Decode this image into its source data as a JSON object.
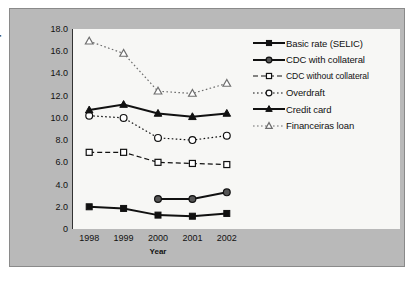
{
  "chart_data": {
    "type": "line",
    "title": "",
    "xlabel": "Year",
    "ylabel": "Percent per month",
    "categories": [
      "1998",
      "1999",
      "2000",
      "2001",
      "2002"
    ],
    "ylim": [
      0,
      18
    ],
    "ytick_labels": [
      "0",
      "2.0",
      "4.0",
      "6.0",
      "8.0",
      "10.0",
      "12.0",
      "14.0",
      "16.0",
      "18.0"
    ],
    "ytick_values": [
      0,
      2,
      4,
      6,
      8,
      10,
      12,
      14,
      16,
      18
    ],
    "grid": false,
    "legend_position": "right",
    "series": [
      {
        "name": "Basic rate (SELIC)",
        "marker": "filled-square",
        "line": "solid",
        "color": "#111111",
        "values": [
          2.0,
          1.85,
          1.25,
          1.15,
          1.4
        ]
      },
      {
        "name": "CDC with collateral",
        "marker": "filled-circle",
        "line": "solid",
        "color": "#111111",
        "values": [
          null,
          null,
          2.7,
          2.7,
          3.3
        ]
      },
      {
        "name": "CDC without collateral",
        "marker": "open-square",
        "line": "dashed",
        "color": "#111111",
        "values": [
          6.9,
          6.9,
          6.0,
          5.9,
          5.8
        ]
      },
      {
        "name": "Overdraft",
        "marker": "open-circle",
        "line": "dotted",
        "color": "#111111",
        "values": [
          10.2,
          10.0,
          8.2,
          8.0,
          8.4
        ]
      },
      {
        "name": "Credit card",
        "marker": "filled-triangle",
        "line": "solid",
        "color": "#111111",
        "values": [
          10.7,
          11.2,
          10.4,
          10.1,
          10.4
        ]
      },
      {
        "name": "Financeiras loan",
        "marker": "open-triangle",
        "line": "dotted",
        "color": "#6e6e6e",
        "values": [
          16.9,
          15.8,
          12.4,
          12.2,
          13.1
        ]
      }
    ]
  }
}
